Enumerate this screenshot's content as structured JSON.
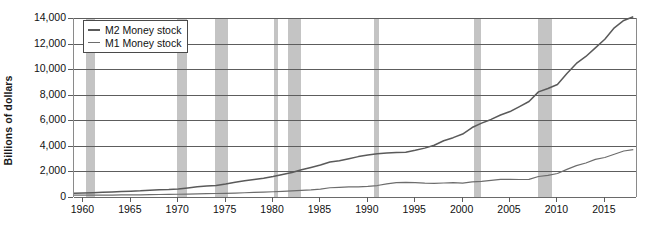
{
  "chart_data": {
    "type": "line",
    "title": "",
    "xlabel": "",
    "ylabel": "Billions of dollars",
    "xlim": [
      1959,
      2018.5
    ],
    "ylim": [
      0,
      14000
    ],
    "y_ticks": [
      "0",
      "2,000",
      "4,000",
      "6,000",
      "8,000",
      "10,000",
      "12,000",
      "14,000"
    ],
    "y_tick_values": [
      0,
      2000,
      4000,
      6000,
      8000,
      10000,
      12000,
      14000
    ],
    "x_ticks": [
      "1960",
      "1965",
      "1970",
      "1975",
      "1980",
      "1985",
      "1990",
      "1995",
      "2000",
      "2005",
      "2010",
      "2015"
    ],
    "x_tick_values": [
      1960,
      1965,
      1970,
      1975,
      1980,
      1985,
      1990,
      1995,
      2000,
      2005,
      2010,
      2015
    ],
    "grid": "horizontal",
    "legend_position": "top-left",
    "legend": [
      "M2 Money stock",
      "M1 Money stock"
    ],
    "recession_bands": [
      {
        "start": 1960.3,
        "end": 1961.2
      },
      {
        "start": 1969.9,
        "end": 1970.9
      },
      {
        "start": 1973.9,
        "end": 1975.2
      },
      {
        "start": 1980.1,
        "end": 1980.5
      },
      {
        "start": 1981.6,
        "end": 1982.9
      },
      {
        "start": 1990.6,
        "end": 1991.2
      },
      {
        "start": 2001.2,
        "end": 2001.9
      },
      {
        "start": 2007.9,
        "end": 2009.4
      }
    ],
    "series": [
      {
        "name": "M2 Money stock",
        "color": "#5a5a5a",
        "x": [
          1959,
          1960,
          1961,
          1962,
          1963,
          1964,
          1965,
          1966,
          1967,
          1968,
          1969,
          1970,
          1971,
          1972,
          1973,
          1974,
          1975,
          1976,
          1977,
          1978,
          1979,
          1980,
          1981,
          1982,
          1983,
          1984,
          1985,
          1986,
          1987,
          1988,
          1989,
          1990,
          1991,
          1992,
          1993,
          1994,
          1995,
          1996,
          1997,
          1998,
          1999,
          2000,
          2001,
          2002,
          2003,
          2004,
          2005,
          2006,
          2007,
          2008,
          2009,
          2010,
          2011,
          2012,
          2013,
          2014,
          2015,
          2016,
          2017,
          2018
        ],
        "values": [
          298,
          312,
          336,
          363,
          393,
          425,
          459,
          480,
          525,
          567,
          588,
          627,
          710,
          802,
          856,
          902,
          1016,
          1152,
          1270,
          1366,
          1474,
          1600,
          1756,
          1911,
          2127,
          2311,
          2497,
          2734,
          2832,
          2995,
          3159,
          3279,
          3379,
          3434,
          3487,
          3502,
          3649,
          3824,
          4046,
          4401,
          4640,
          4925,
          5434,
          5775,
          6067,
          6413,
          6682,
          7071,
          7470,
          8220,
          8490,
          8800,
          9660,
          10450,
          10990,
          11660,
          12340,
          13230,
          13810,
          14100
        ],
        "end_value": 13800
      },
      {
        "name": "M1 Money stock",
        "color": "#6d6d6d",
        "x": [
          1959,
          1960,
          1961,
          1962,
          1963,
          1964,
          1965,
          1966,
          1967,
          1968,
          1969,
          1970,
          1971,
          1972,
          1973,
          1974,
          1975,
          1976,
          1977,
          1978,
          1979,
          1980,
          1981,
          1982,
          1983,
          1984,
          1985,
          1986,
          1987,
          1988,
          1989,
          1990,
          1991,
          1992,
          1993,
          1994,
          1995,
          1996,
          1997,
          1998,
          1999,
          2000,
          2001,
          2002,
          2003,
          2004,
          2005,
          2006,
          2007,
          2008,
          2009,
          2010,
          2011,
          2012,
          2013,
          2014,
          2015,
          2016,
          2017,
          2018
        ],
        "values": [
          139,
          141,
          146,
          149,
          154,
          161,
          168,
          172,
          183,
          197,
          204,
          214,
          228,
          249,
          263,
          274,
          287,
          306,
          331,
          358,
          382,
          409,
          436,
          474,
          521,
          552,
          620,
          725,
          750,
          787,
          794,
          826,
          897,
          1025,
          1130,
          1150,
          1128,
          1081,
          1073,
          1095,
          1123,
          1088,
          1183,
          1220,
          1306,
          1376,
          1375,
          1367,
          1374,
          1605,
          1695,
          1840,
          2160,
          2450,
          2660,
          2940,
          3090,
          3340,
          3600,
          3700
        ],
        "end_value": 3600
      }
    ],
    "colors": {
      "band": "#c4c4c4",
      "gridline": "#5d5d5d",
      "axis": "#8a8a8a",
      "m2": "#5a5a5a",
      "m1": "#6d6d6d"
    }
  }
}
